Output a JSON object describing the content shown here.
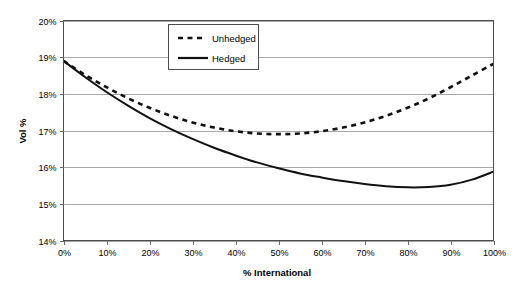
{
  "chart_data": {
    "type": "line",
    "title": "",
    "xlabel": "% International",
    "ylabel": "Vol %",
    "xlim": [
      0,
      100
    ],
    "ylim": [
      14,
      20
    ],
    "grid": true,
    "legend_position": "upper-center",
    "x_tick_labels": [
      "0%",
      "10%",
      "20%",
      "30%",
      "40%",
      "50%",
      "60%",
      "70%",
      "80%",
      "90%",
      "100%"
    ],
    "y_tick_labels": [
      "14%",
      "15%",
      "16%",
      "17%",
      "18%",
      "19%",
      "20%"
    ],
    "x": [
      0,
      5,
      10,
      15,
      20,
      25,
      30,
      35,
      40,
      45,
      50,
      55,
      60,
      65,
      70,
      75,
      80,
      85,
      90,
      95,
      100
    ],
    "series": [
      {
        "name": "Unhedged",
        "style": "dashed",
        "color": "#111111",
        "values": [
          18.9,
          18.52,
          18.18,
          17.88,
          17.62,
          17.4,
          17.22,
          17.08,
          16.98,
          16.92,
          16.9,
          16.92,
          16.98,
          17.08,
          17.22,
          17.4,
          17.62,
          17.88,
          18.18,
          18.5,
          18.82
        ]
      },
      {
        "name": "Hedged",
        "style": "solid",
        "color": "#111111",
        "values": [
          18.9,
          18.46,
          18.05,
          17.68,
          17.34,
          17.04,
          16.77,
          16.53,
          16.32,
          16.13,
          15.97,
          15.83,
          15.72,
          15.62,
          15.54,
          15.48,
          15.45,
          15.46,
          15.52,
          15.66,
          15.88
        ]
      }
    ]
  },
  "legend": {
    "items": [
      {
        "label": "Unhedged"
      },
      {
        "label": "Hedged"
      }
    ]
  },
  "axes": {
    "y_axis_title": "Vol %",
    "x_axis_title": "% International"
  }
}
